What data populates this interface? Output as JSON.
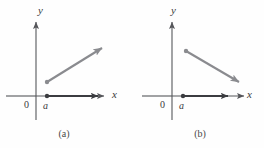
{
  "figure": {
    "colors": {
      "axis": "#55565a",
      "vector_dark": "#3b3c40",
      "vector_gray": "#8a8b8f",
      "text": "#3a3a3a",
      "background": "#fefefe"
    },
    "panels": [
      {
        "id": "a",
        "caption": "(a)",
        "y_axis_label": "y",
        "x_axis_label": "x",
        "origin_label": "0",
        "point_label": "a",
        "origin": {
          "x": 36,
          "y": 96
        },
        "y_axis": {
          "x": 36,
          "top": 20,
          "bottom": 120
        },
        "x_axis": {
          "y": 96,
          "left": 6,
          "right": 108
        },
        "dark_vector": {
          "name": "horizontal-vector",
          "from": {
            "x": 47,
            "y": 96
          },
          "to": {
            "x": 102,
            "y": 96
          },
          "direction": "right",
          "color": "#3b3c40"
        },
        "gray_vector": {
          "name": "diagonal-vector-up-right",
          "from": {
            "x": 47,
            "y": 82
          },
          "to": {
            "x": 107,
            "y": 45
          },
          "direction": "up-right",
          "color": "#8a8b8f"
        },
        "base_point": {
          "x": 47,
          "y": 96
        }
      },
      {
        "id": "b",
        "caption": "(b)",
        "y_axis_label": "y",
        "x_axis_label": "x",
        "origin_label": "0",
        "point_label": "a",
        "origin": {
          "x": 40,
          "y": 96
        },
        "y_axis": {
          "x": 40,
          "top": 20,
          "bottom": 120
        },
        "x_axis": {
          "y": 96,
          "left": 10,
          "right": 112
        },
        "dark_vector": {
          "name": "horizontal-vector",
          "from": {
            "x": 51,
            "y": 96
          },
          "to": {
            "x": 100,
            "y": 96
          },
          "direction": "right",
          "color": "#3b3c40"
        },
        "gray_vector": {
          "name": "diagonal-vector-down-right",
          "from": {
            "x": 54,
            "y": 51
          },
          "to": {
            "x": 112,
            "y": 85
          },
          "direction": "down-right",
          "color": "#8a8b8f"
        },
        "base_point": {
          "x": 51,
          "y": 96
        }
      }
    ]
  }
}
